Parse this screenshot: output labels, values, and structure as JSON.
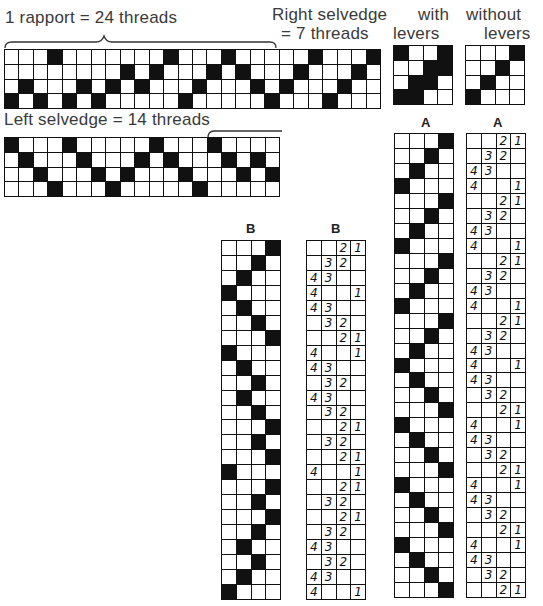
{
  "labels": {
    "rapport": "1 rapport = 24 threads",
    "right_selvedge_line1": "Right selvedge",
    "right_selvedge_line2": "= 7 threads",
    "with_line1": "with",
    "with_line2": "levers",
    "without_line1": "without",
    "without_line2": "levers",
    "left_selvedge": "Left selvedge = 14 threads",
    "a_with": "A",
    "a_without": "A",
    "b_with": "B",
    "b_without": "B"
  },
  "colors": {
    "ink": "#111111",
    "paper": "#ffffff",
    "text": "#3a3a3a"
  },
  "top_grid": {
    "cols": 26,
    "rows": 4,
    "filled_by_row": [
      [
        4,
        12,
        16,
        22,
        26
      ],
      [
        9,
        11,
        15,
        17,
        21,
        25
      ],
      [
        2,
        6,
        8,
        10,
        14,
        18,
        20,
        24
      ],
      [
        1,
        3,
        5,
        7,
        13,
        19,
        23
      ]
    ]
  },
  "with_levers_box": {
    "cols": 4,
    "rows": 4,
    "filled_by_row": [
      [
        1,
        4
      ],
      [
        3,
        4
      ],
      [
        2,
        3
      ],
      [
        1,
        2
      ]
    ]
  },
  "without_levers_box": {
    "cols": 4,
    "rows": 4,
    "filled_by_row": [
      [
        4
      ],
      [
        3
      ],
      [
        2
      ],
      [
        1
      ]
    ]
  },
  "left_selvedge_grid": {
    "cols": 19,
    "rows": 4,
    "filled_by_row": [
      [
        1,
        5,
        11,
        15
      ],
      [
        2,
        6,
        10,
        12,
        16,
        18
      ],
      [
        3,
        7,
        9,
        13,
        17,
        19
      ],
      [
        4,
        8,
        14
      ]
    ]
  },
  "lever_numbering": {
    "1": [
      "4",
      "",
      "",
      "1"
    ],
    "2": [
      "4",
      "3",
      "",
      ""
    ],
    "3": [
      "",
      "3",
      "2",
      ""
    ],
    "4": [
      "",
      "",
      "2",
      "1"
    ]
  },
  "column_a": {
    "rows": 31,
    "filled_col_per_row": [
      4,
      3,
      2,
      1,
      4,
      3,
      2,
      1,
      4,
      3,
      2,
      1,
      4,
      3,
      2,
      1,
      2,
      3,
      4,
      1,
      2,
      3,
      4,
      1,
      2,
      3,
      4,
      1,
      2,
      3,
      4
    ]
  },
  "column_b": {
    "rows": 24,
    "filled_col_per_row": [
      4,
      3,
      2,
      1,
      2,
      3,
      4,
      1,
      2,
      3,
      2,
      3,
      4,
      3,
      4,
      1,
      4,
      3,
      4,
      3,
      2,
      3,
      2,
      1
    ]
  }
}
